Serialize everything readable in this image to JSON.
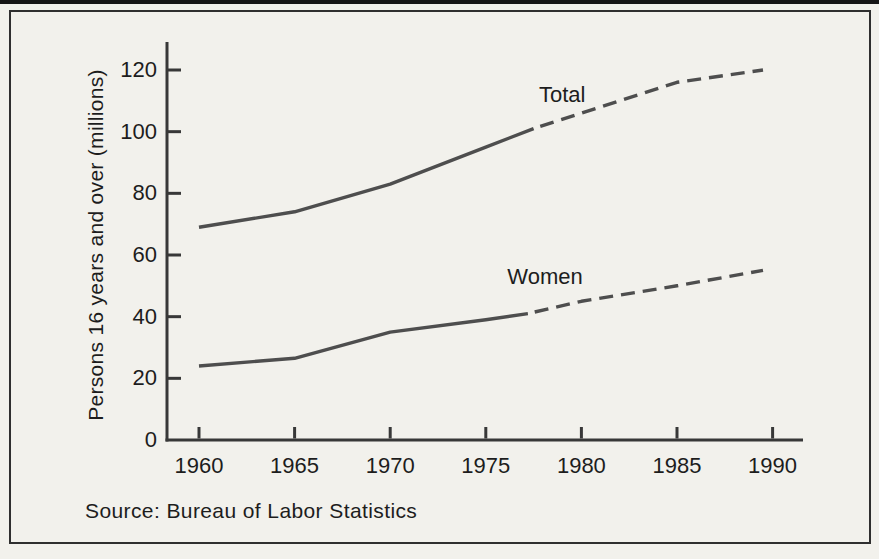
{
  "chart_data": {
    "type": "line",
    "title": "",
    "xlabel": "",
    "ylabel": "Persons 16 years and over (millions)",
    "source": "Source: Bureau of Labor Statistics",
    "x_ticks": [
      1960,
      1965,
      1970,
      1975,
      1980,
      1985,
      1990
    ],
    "y_ticks": [
      0,
      20,
      40,
      60,
      80,
      100,
      120
    ],
    "xlim": [
      1958.3,
      1991.6
    ],
    "ylim": [
      0,
      129
    ],
    "grid": false,
    "legend": "inline-labels",
    "line_color": "#4e4e4e",
    "axis_color": "#383838",
    "series": [
      {
        "name": "Total (actual)",
        "slug": "total-actual",
        "style": "solid",
        "x": [
          1960,
          1965,
          1970,
          1975,
          1977.5
        ],
        "y": [
          69,
          74,
          83,
          95,
          101
        ]
      },
      {
        "name": "Total (projected)",
        "slug": "total-projected",
        "style": "dashed",
        "x": [
          1977.5,
          1980,
          1985,
          1989.5
        ],
        "y": [
          101,
          106,
          116,
          120
        ]
      },
      {
        "name": "Women (actual)",
        "slug": "women-actual",
        "style": "solid",
        "x": [
          1960,
          1965,
          1970,
          1975,
          1977.2
        ],
        "y": [
          24,
          26.5,
          35,
          39,
          41
        ]
      },
      {
        "name": "Women (projected)",
        "slug": "women-projected",
        "style": "dashed",
        "x": [
          1977.2,
          1980,
          1985,
          1989.5
        ],
        "y": [
          41,
          45,
          50,
          55
        ]
      }
    ],
    "labels": [
      {
        "text": "Total",
        "x": 1979.0,
        "y": 112
      },
      {
        "text": "Women",
        "x": 1978.1,
        "y": 53
      }
    ]
  }
}
